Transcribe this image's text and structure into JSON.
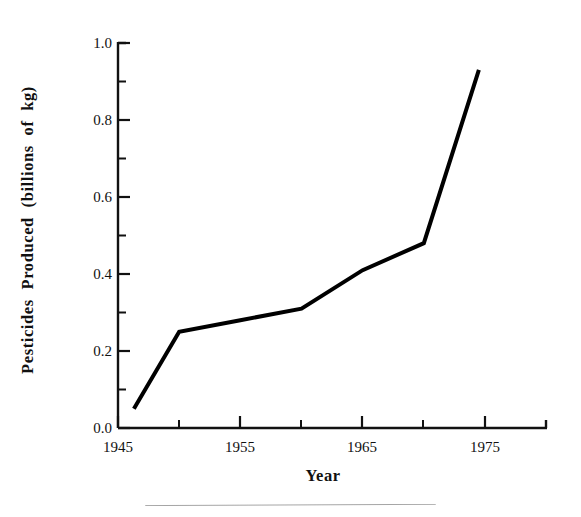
{
  "figure": {
    "background": "#ffffff",
    "ink_color": "#111111",
    "line_color": "#000000"
  },
  "axis_titles": {
    "y": "Pesticides  Produced  (billions  of  kg)",
    "x": "Year"
  },
  "y_ticks": {
    "labels": [
      "0.0",
      "0.2",
      "0.4",
      "0.6",
      "0.8",
      "1.0"
    ],
    "values": [
      0.0,
      0.2,
      0.4,
      0.6,
      0.8,
      1.0
    ],
    "minor_values": [
      0.1,
      0.3,
      0.5,
      0.7,
      0.9
    ]
  },
  "x_ticks": {
    "labels": [
      "1945",
      "1955",
      "1965",
      "1975"
    ],
    "values": [
      1945,
      1955,
      1965,
      1975
    ],
    "minor_values": [
      1950,
      1960,
      1970
    ]
  },
  "chart_data": {
    "type": "line",
    "title": "",
    "subtitle": "",
    "xlabel": "Year",
    "ylabel": "Pesticides Produced (billions of kg)",
    "xlim": [
      1945,
      1979
    ],
    "ylim": [
      0.0,
      1.0
    ],
    "grid": false,
    "legend": "none",
    "x": [
      1946.3,
      1950.0,
      1955.0,
      1960.0,
      1965.0,
      1970.0,
      1974.5
    ],
    "values": [
      0.05,
      0.25,
      0.28,
      0.31,
      0.41,
      0.48,
      0.93
    ],
    "series": [
      {
        "name": "Pesticides produced",
        "x": [
          1946.3,
          1950.0,
          1955.0,
          1960.0,
          1965.0,
          1970.0,
          1974.5
        ],
        "values": [
          0.05,
          0.25,
          0.28,
          0.31,
          0.41,
          0.48,
          0.93
        ]
      }
    ],
    "annotations": []
  }
}
